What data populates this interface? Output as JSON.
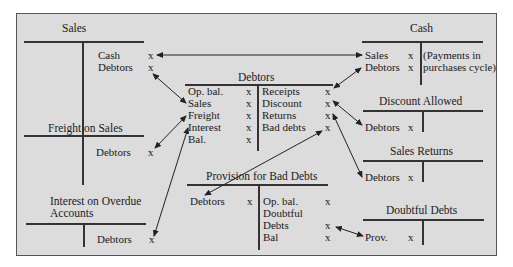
{
  "accounts": {
    "sales": {
      "title": "Sales",
      "credit": [
        {
          "label": "Cash",
          "value": "x"
        },
        {
          "label": "Debtors",
          "value": "x"
        }
      ]
    },
    "cash": {
      "title": "Cash",
      "debit": [
        {
          "label": "Sales",
          "value": "x"
        },
        {
          "label": "Debtors",
          "value": "x"
        }
      ],
      "credit_note_line1": "(Payments in",
      "credit_note_line2": "purchases cycle)"
    },
    "debtors": {
      "title": "Debtors",
      "debit": [
        {
          "label": "Op. bal.",
          "value": "x"
        },
        {
          "label": "Sales",
          "value": "x"
        },
        {
          "label": "Freight",
          "value": "x"
        },
        {
          "label": "Interest",
          "value": "x"
        },
        {
          "label": "Bal.",
          "value": "x"
        }
      ],
      "credit": [
        {
          "label": "Receipts",
          "value": "x"
        },
        {
          "label": "Discount",
          "value": "x"
        },
        {
          "label": "Returns",
          "value": "x"
        },
        {
          "label": "Bad debts",
          "value": "x"
        }
      ]
    },
    "discount_allowed": {
      "title": "Discount Allowed",
      "debit": [
        {
          "label": "Debtors",
          "value": "x"
        }
      ]
    },
    "freight_on_sales": {
      "title": "Freight on Sales",
      "credit": [
        {
          "label": "Debtors",
          "value": "x"
        }
      ]
    },
    "sales_returns": {
      "title": "Sales Returns",
      "debit": [
        {
          "label": "Debtors",
          "value": "x"
        }
      ]
    },
    "provision_bad_debts": {
      "title": "Provision for Bad Debts",
      "debit": [
        {
          "label": "Debtors",
          "value": "x"
        }
      ],
      "credit": [
        {
          "label": "Op. bal.",
          "value": "x"
        },
        {
          "label": "Doubtful",
          "value": ""
        },
        {
          "label": "Debts",
          "value": "x"
        },
        {
          "label": "Bal",
          "value": "x"
        }
      ]
    },
    "interest_overdue": {
      "title_line1": "Interest on Overdue",
      "title_line2": "Accounts",
      "credit": [
        {
          "label": "Debtors",
          "value": "x"
        }
      ]
    },
    "doubtful_debts": {
      "title": "Doubtful Debts",
      "debit": [
        {
          "label": "Prov.",
          "value": "x"
        }
      ]
    }
  },
  "colors": {
    "background": "#dcdcdc",
    "lines": "#333333",
    "border": "#555555"
  }
}
